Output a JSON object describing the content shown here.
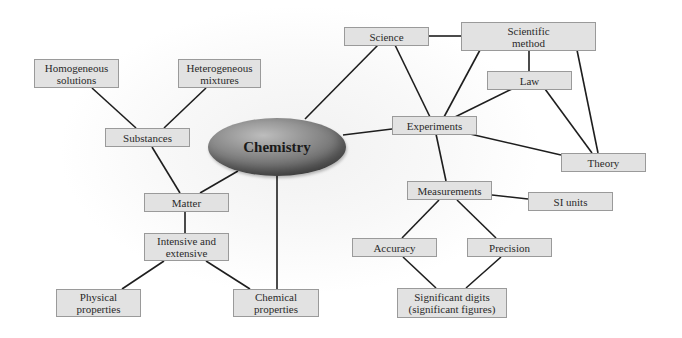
{
  "central": {
    "label": "Chemistry"
  },
  "nodes": {
    "homogeneous": {
      "label": "Homogeneous\nsolutions"
    },
    "heterogeneous": {
      "label": "Heterogeneous\nmixtures"
    },
    "substances": {
      "label": "Substances"
    },
    "matter": {
      "label": "Matter"
    },
    "intensive": {
      "label": "Intensive and\nextensive"
    },
    "physical": {
      "label": "Physical\nproperties"
    },
    "chemical": {
      "label": "Chemical\nproperties"
    },
    "science": {
      "label": "Science"
    },
    "scientific_method": {
      "label": "Scientific\nmethod"
    },
    "law": {
      "label": "Law"
    },
    "experiments": {
      "label": "Experiments"
    },
    "theory": {
      "label": "Theory"
    },
    "measurements": {
      "label": "Measurements"
    },
    "si_units": {
      "label": "SI units"
    },
    "accuracy": {
      "label": "Accuracy"
    },
    "precision": {
      "label": "Precision"
    },
    "significant": {
      "label": "Significant digits\n(significant figures)"
    }
  },
  "edges": [
    [
      "Homogeneous solutions",
      "Substances"
    ],
    [
      "Heterogeneous mixtures",
      "Substances"
    ],
    [
      "Substances",
      "Matter"
    ],
    [
      "Chemistry",
      "Matter"
    ],
    [
      "Matter",
      "Intensive and extensive"
    ],
    [
      "Intensive and extensive",
      "Physical properties"
    ],
    [
      "Intensive and extensive",
      "Chemical properties"
    ],
    [
      "Chemistry",
      "Chemical properties"
    ],
    [
      "Chemistry",
      "Science"
    ],
    [
      "Chemistry",
      "Experiments"
    ],
    [
      "Science",
      "Scientific method"
    ],
    [
      "Science",
      "Experiments"
    ],
    [
      "Scientific method",
      "Experiments"
    ],
    [
      "Scientific method",
      "Law"
    ],
    [
      "Scientific method",
      "Theory"
    ],
    [
      "Law",
      "Experiments"
    ],
    [
      "Law",
      "Theory"
    ],
    [
      "Experiments",
      "Theory"
    ],
    [
      "Experiments",
      "Measurements"
    ],
    [
      "Measurements",
      "SI units"
    ],
    [
      "Measurements",
      "Accuracy"
    ],
    [
      "Measurements",
      "Precision"
    ],
    [
      "Accuracy",
      "Significant digits"
    ],
    [
      "Precision",
      "Significant digits"
    ]
  ],
  "colors": {
    "node_fill": "#e2e2e2",
    "node_border": "#9a9a9a",
    "line": "#1e1e1e",
    "central_fill": "#8e8e8e"
  }
}
